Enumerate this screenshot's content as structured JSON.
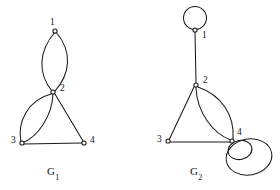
{
  "figure": {
    "type": "multigraph-diagram",
    "width": 280,
    "height": 190,
    "background": "#ffffff",
    "ink_color": "#1a1a1a"
  },
  "graphs": [
    {
      "id": "G1",
      "caption_base": "G",
      "caption_sub": "1",
      "caption_text": "G1",
      "caption_pos": {
        "x": 47,
        "y": 166
      },
      "vertices": [
        {
          "id": "1",
          "label": "1",
          "x": 55,
          "y": 31,
          "label_x": 50,
          "label_y": 18
        },
        {
          "id": "2",
          "label": "2",
          "x": 53,
          "y": 92,
          "label_x": 60,
          "label_y": 84
        },
        {
          "id": "3",
          "label": "3",
          "x": 22,
          "y": 143,
          "label_x": 11,
          "label_y": 136
        },
        {
          "id": "4",
          "label": "4",
          "x": 84,
          "y": 143,
          "label_x": 90,
          "label_y": 136
        }
      ],
      "edges": [
        {
          "from": "1",
          "to": "2",
          "kind": "curve",
          "note": "parallel-edge-left"
        },
        {
          "from": "1",
          "to": "2",
          "kind": "curve",
          "note": "parallel-edge-right"
        },
        {
          "from": "2",
          "to": "3",
          "kind": "curve",
          "note": "parallel-edge-outer"
        },
        {
          "from": "2",
          "to": "3",
          "kind": "curve",
          "note": "parallel-edge-inner"
        },
        {
          "from": "2",
          "to": "4",
          "kind": "straight",
          "note": ""
        },
        {
          "from": "3",
          "to": "4",
          "kind": "straight",
          "note": ""
        }
      ],
      "loops": []
    },
    {
      "id": "G2",
      "caption_base": "G",
      "caption_sub": "2",
      "caption_text": "G2",
      "caption_pos": {
        "x": 190,
        "y": 166
      },
      "vertices": [
        {
          "id": "1",
          "label": "1",
          "x": 195,
          "y": 30,
          "label_x": 202,
          "label_y": 31
        },
        {
          "id": "2",
          "label": "2",
          "x": 196,
          "y": 85,
          "label_x": 203,
          "label_y": 76
        },
        {
          "id": "3",
          "label": "3",
          "x": 168,
          "y": 141,
          "label_x": 157,
          "label_y": 135
        },
        {
          "id": "4",
          "label": "4",
          "x": 232,
          "y": 141,
          "label_x": 237,
          "label_y": 128
        }
      ],
      "edges": [
        {
          "from": "1",
          "to": "2",
          "kind": "straight",
          "note": ""
        },
        {
          "from": "2",
          "to": "3",
          "kind": "straight",
          "note": ""
        },
        {
          "from": "2",
          "to": "4",
          "kind": "curve",
          "note": "parallel-edge-outer"
        },
        {
          "from": "2",
          "to": "4",
          "kind": "curve",
          "note": "parallel-edge-inner"
        },
        {
          "from": "3",
          "to": "4",
          "kind": "straight",
          "note": ""
        }
      ],
      "loops": [
        {
          "at": "1",
          "size": "medium",
          "direction": "up",
          "note": "self-loop-above-vertex-1"
        },
        {
          "at": "4",
          "size": "small",
          "direction": "down-right",
          "note": "self-loop-inner-vertex-4"
        },
        {
          "at": "4",
          "size": "large",
          "direction": "down-right",
          "note": "self-loop-outer-vertex-4"
        }
      ]
    }
  ]
}
